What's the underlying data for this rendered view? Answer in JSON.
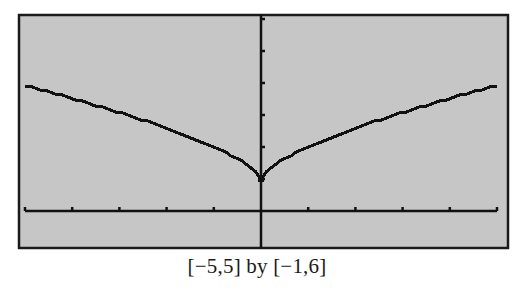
{
  "chart_data": {
    "type": "line",
    "title": "",
    "caption": "[−5,5] by [−1,6]",
    "function": "y = x^(2/3) + 1",
    "xlabel": "",
    "ylabel": "",
    "xlim": [
      -5,
      5
    ],
    "ylim": [
      -1,
      6
    ],
    "x_ticks": [
      -5,
      -4,
      -3,
      -2,
      -1,
      0,
      1,
      2,
      3,
      4,
      5
    ],
    "y_ticks": [
      1,
      2,
      3,
      4,
      5,
      6
    ],
    "grid": false,
    "legend": null,
    "series": [
      {
        "name": "y = x^(2/3) + 1",
        "x": [
          -5,
          -4,
          -3,
          -2,
          -1,
          -0.5,
          0,
          0.5,
          1,
          2,
          3,
          4,
          5
        ],
        "y": [
          3.92,
          3.52,
          3.08,
          2.59,
          2.0,
          1.63,
          1.0,
          1.63,
          2.0,
          2.59,
          3.08,
          3.52,
          3.92
        ]
      }
    ]
  },
  "colors": {
    "screen_background": "#c6c6c6",
    "frame": "#1a1a1a",
    "axes": "#111111",
    "curve": "#111111",
    "page_background": "#ffffff"
  },
  "caption": {
    "text": "[−5,5] by [−1,6]"
  }
}
